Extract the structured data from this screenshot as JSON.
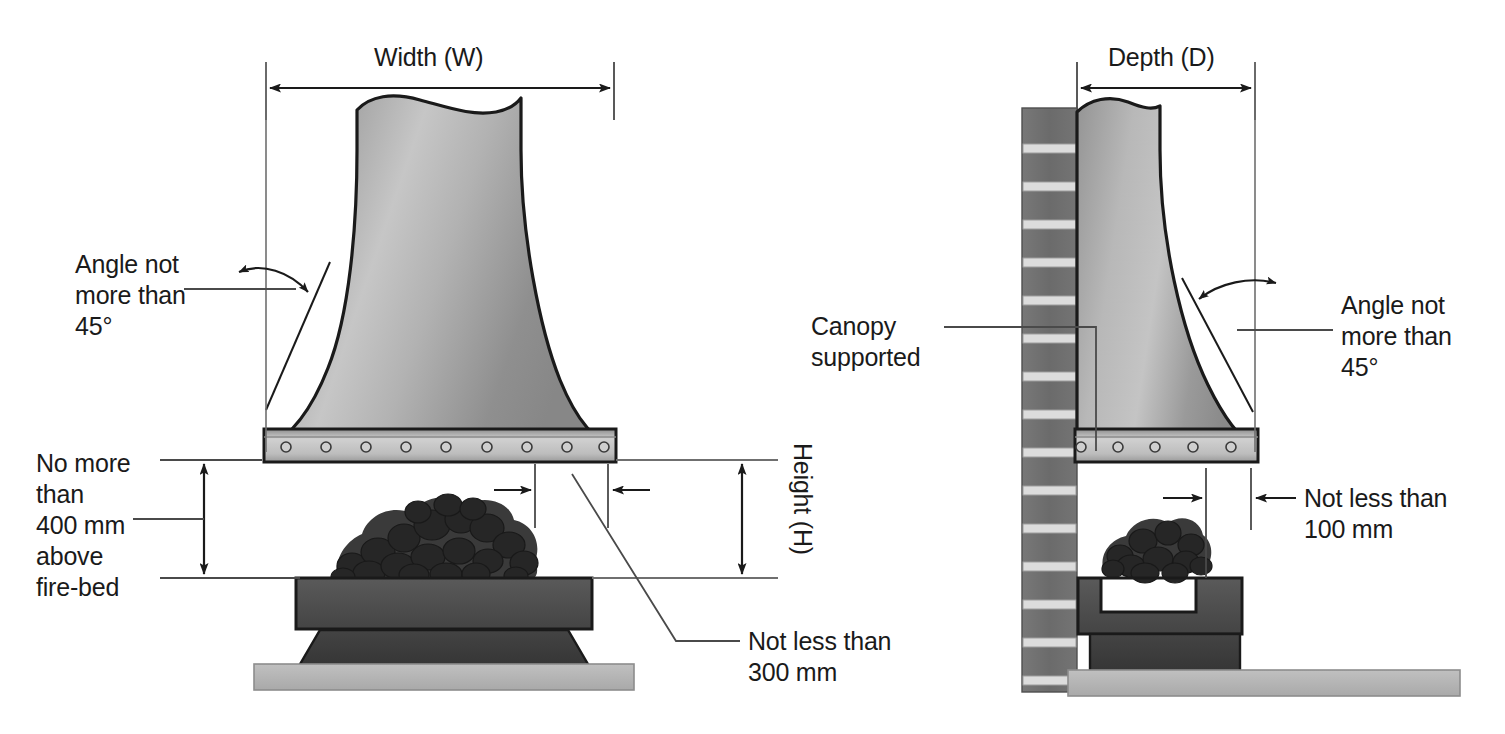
{
  "diagram": {
    "views": [
      {
        "name": "front-elevation",
        "label": "Width (W)"
      },
      {
        "name": "side-elevation",
        "label": "Depth (D)"
      }
    ]
  },
  "colors": {
    "line": "#1a1a1a",
    "thin_line": "#595959",
    "hood_light": "#d2d2d2",
    "hood_mid": "#9a9a9a",
    "hood_dark": "#8a8a8a",
    "rim_light": "#c9c9c9",
    "rim_dark": "#8f8f8f",
    "brick": "#6e6e6e",
    "mortar": "#d8d8d8",
    "hearth_upper": "#4a4a4a",
    "hearth_lower": "#3a3a3a",
    "floor": "#b4b4b4",
    "coal_dark": "#2f2f2f",
    "coal_mid": "#3f3f3f",
    "text": "#1a1a1a"
  },
  "left_view": {
    "name": "front-elevation",
    "width_label": "Width (W)",
    "height_label": "Height (H)",
    "angle_note": "Angle not\nmore than\n45°",
    "above_firebed_note": "No more\nthan\n400 mm\nabove\nfire-bed",
    "overhang_note": "Not less than\n300 mm"
  },
  "right_view": {
    "name": "side-elevation",
    "depth_label": "Depth (D)",
    "angle_note": "Angle not\nmore than\n45°",
    "canopy_support_note": "Canopy\nsupported",
    "clearance_note": "Not less than\n100 mm"
  },
  "measurements": [
    {
      "id": "width",
      "label": "Width (W)",
      "view": "front-elevation",
      "kind": "horizontal-dimension"
    },
    {
      "id": "height",
      "label": "Height (H)",
      "view": "front-elevation",
      "kind": "vertical-dimension"
    },
    {
      "id": "above-bed",
      "label": "No more than 400 mm above fire-bed",
      "value": "400 mm",
      "view": "front-elevation",
      "kind": "vertical-dimension"
    },
    {
      "id": "overhang",
      "label": "Not less than 300 mm",
      "value": "300 mm",
      "view": "front-elevation",
      "kind": "horizontal-dimension"
    },
    {
      "id": "depth",
      "label": "Depth (D)",
      "view": "side-elevation",
      "kind": "horizontal-dimension"
    },
    {
      "id": "clearance",
      "label": "Not less than 100 mm",
      "value": "100 mm",
      "view": "side-elevation",
      "kind": "horizontal-dimension"
    },
    {
      "id": "angle-left",
      "label": "Angle not more than 45°",
      "value": "45°",
      "view": "front-elevation",
      "kind": "angle"
    },
    {
      "id": "angle-right",
      "label": "Angle not more than 45°",
      "value": "45°",
      "view": "side-elevation",
      "kind": "angle"
    }
  ]
}
